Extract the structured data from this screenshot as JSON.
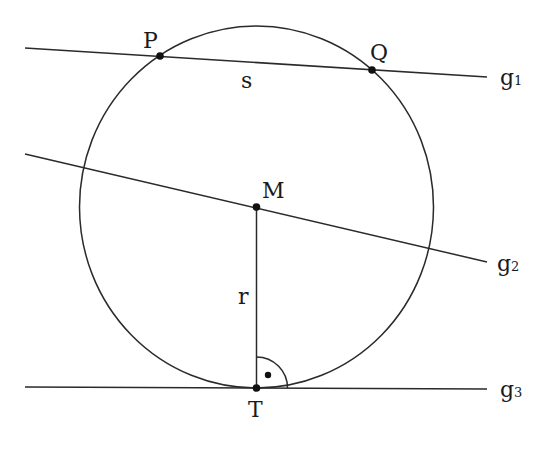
{
  "diagram": {
    "circle": {
      "cx": 256.5,
      "cy": 207,
      "rx": 177,
      "ry": 181
    },
    "lines": [
      {
        "id": "g1",
        "x1": 25,
        "y1": 48,
        "x2": 487,
        "y2": 77,
        "label": "g",
        "subscript": "1",
        "label_x": 500,
        "label_y": 85
      },
      {
        "id": "g2",
        "x1": 25,
        "y1": 154,
        "x2": 487,
        "y2": 262,
        "label": "g",
        "subscript": "2",
        "label_x": 497,
        "label_y": 271
      },
      {
        "id": "g3",
        "x1": 25,
        "y1": 387,
        "x2": 487,
        "y2": 389,
        "label": "g",
        "subscript": "3",
        "label_x": 500,
        "label_y": 397
      }
    ],
    "radius_segment": {
      "x1": 256.5,
      "y1": 207,
      "x2": 256.5,
      "y2": 388,
      "label": "r",
      "label_x": 238,
      "label_y": 304
    },
    "points": [
      {
        "id": "P",
        "x": 160,
        "y": 56,
        "label": "P",
        "label_x": 143,
        "label_y": 48
      },
      {
        "id": "Q",
        "x": 372,
        "y": 70,
        "label": "Q",
        "label_x": 370,
        "label_y": 60
      },
      {
        "id": "M",
        "x": 256.5,
        "y": 207,
        "label": "M",
        "label_x": 262,
        "label_y": 198
      },
      {
        "id": "T",
        "x": 256.5,
        "y": 388,
        "label": "T",
        "label_x": 248,
        "label_y": 417
      }
    ],
    "chord_label": {
      "text": "s",
      "x": 241,
      "y": 88
    },
    "right_angle": {
      "cx": 256.5,
      "cy": 388,
      "r": 31,
      "dot_x": 268,
      "dot_y": 375
    }
  }
}
